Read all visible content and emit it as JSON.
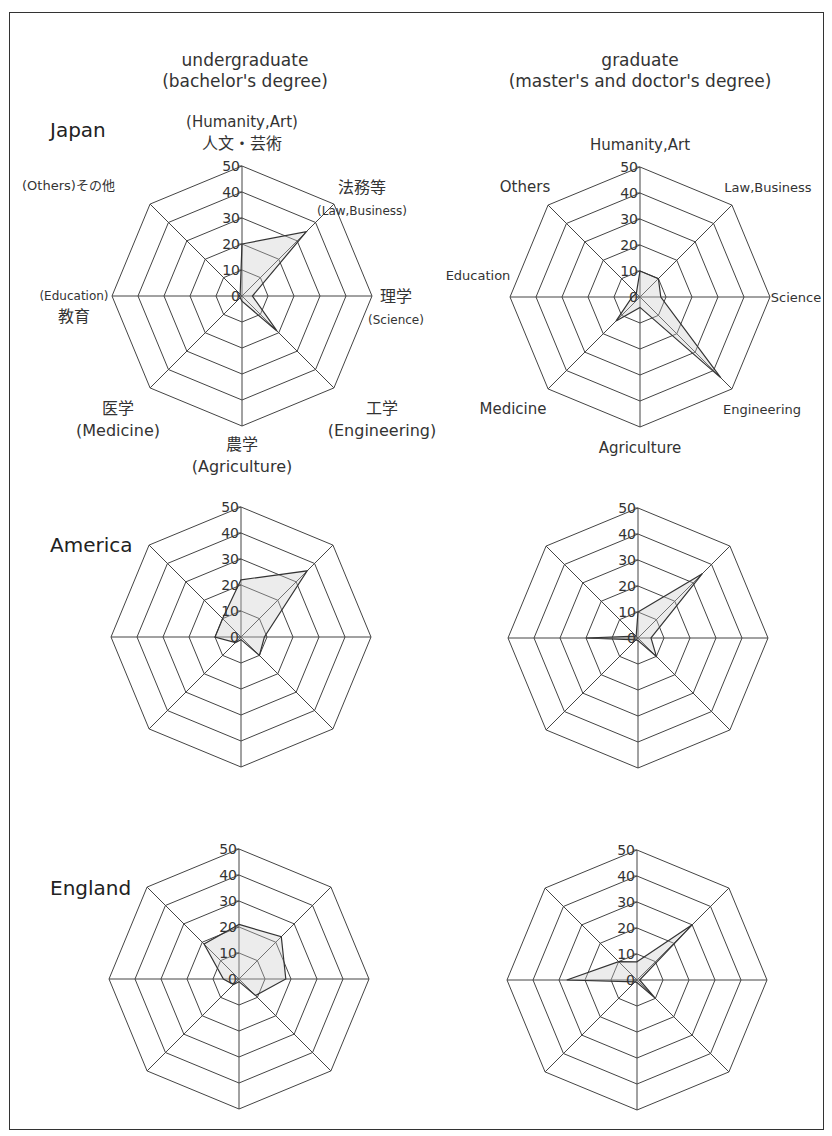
{
  "columns": {
    "undergraduate": {
      "line1": "undergraduate",
      "line2": "(bachelor's degree)"
    },
    "graduate": {
      "line1": "graduate",
      "line2": "(master's and doctor's degree)"
    }
  },
  "countries": [
    "Japan",
    "America",
    "England"
  ],
  "axis_labels": {
    "undergraduate_japan": [
      [
        "(Humanity,Art)",
        "人文・芸術"
      ],
      [
        "法務等",
        "(Law,Business)"
      ],
      [
        "理学",
        "(Science)"
      ],
      [
        "工学",
        "(Engineering)"
      ],
      [
        "農学",
        "(Agriculture)"
      ],
      [
        "医学",
        "(Medicine)"
      ],
      [
        "(Education)",
        "教育"
      ],
      [
        "(Others)その他"
      ]
    ],
    "graduate_japan": [
      "Humanity,Art",
      "Law,Business",
      "Science",
      "Engineering",
      "Agriculture",
      "Medicine",
      "Education",
      "Others"
    ]
  },
  "chart_data": {
    "type": "radar",
    "title": "",
    "axes": [
      "Humanity,Art",
      "Law,Business",
      "Science",
      "Engineering",
      "Agriculture",
      "Medicine",
      "Education",
      "Others"
    ],
    "ticks": [
      0,
      10,
      20,
      30,
      40,
      50
    ],
    "range": [
      0,
      50
    ],
    "charts": [
      {
        "country": "Japan",
        "level": "undergraduate",
        "values": [
          20,
          35,
          4,
          19,
          2,
          1,
          1,
          1
        ]
      },
      {
        "country": "Japan",
        "level": "graduate",
        "values": [
          10,
          10,
          8,
          44,
          4,
          13,
          3,
          2
        ]
      },
      {
        "country": "America",
        "level": "undergraduate",
        "values": [
          22,
          36,
          9,
          10,
          1,
          3,
          10,
          10
        ]
      },
      {
        "country": "America",
        "level": "graduate",
        "values": [
          10,
          35,
          5,
          10,
          1,
          1,
          20,
          1
        ]
      },
      {
        "country": "England",
        "level": "undergraduate",
        "values": [
          21,
          23,
          18,
          9,
          1,
          3,
          6,
          19
        ]
      },
      {
        "country": "England",
        "level": "graduate",
        "values": [
          7,
          30,
          1,
          10,
          1,
          1,
          27,
          10
        ]
      }
    ]
  }
}
